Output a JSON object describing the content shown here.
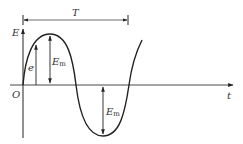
{
  "diagram": {
    "type": "sinusoidal-emf-waveform",
    "axes": {
      "y_label": "E",
      "x_label": "t",
      "origin_label": "O"
    },
    "period": {
      "label": "T"
    },
    "annotations": {
      "instantaneous": "e",
      "amplitude_top": {
        "base": "E",
        "sub": "m"
      },
      "amplitude_bottom": {
        "base": "E",
        "sub": "m"
      }
    },
    "colors": {
      "stroke": "#222222",
      "text": "#333333",
      "background": "#ffffff"
    }
  }
}
